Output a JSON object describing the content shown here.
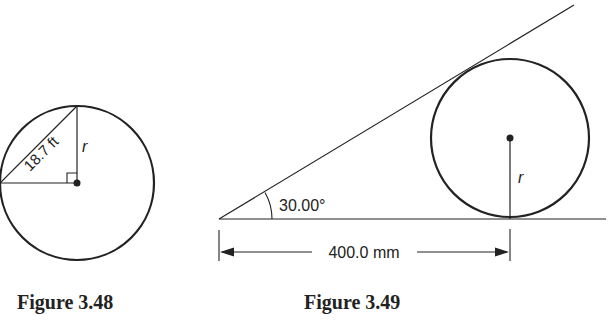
{
  "figures": [
    {
      "caption": "Figure 3.48",
      "labels": {
        "chord": "18.7 ft",
        "radius": "r"
      }
    },
    {
      "caption": "Figure 3.49",
      "labels": {
        "angle": "30.00°",
        "distance": "400.0 mm",
        "radius": "r"
      }
    }
  ],
  "colors": {
    "stroke": "#222222",
    "background": "#ffffff"
  }
}
